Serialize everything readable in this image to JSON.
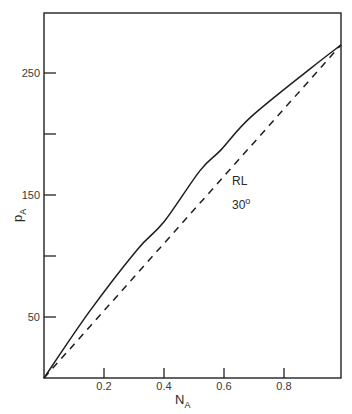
{
  "chart_data": {
    "type": "line",
    "title": "",
    "xlabel": "N",
    "xlabel_sub": "A",
    "ylabel": "p",
    "ylabel_sub": "A",
    "xlim": [
      0,
      0.99
    ],
    "ylim": [
      0,
      272
    ],
    "x_ticks": [
      0.2,
      0.4,
      0.6,
      0.8
    ],
    "x_tick_labels": [
      "0.2",
      "0.4",
      "0.6",
      "0.8"
    ],
    "y_ticks": [
      50,
      100,
      150,
      200,
      250
    ],
    "y_tick_labels": [
      "50",
      "",
      "150",
      "",
      "250"
    ],
    "grid": false,
    "legend": null,
    "annotations": [
      {
        "text": "RL",
        "x": 0.56,
        "y": 160
      },
      {
        "text": "30",
        "superscript": "o",
        "x": 0.56,
        "y": 140
      }
    ],
    "series": [
      {
        "name": "experimental",
        "style": "solid",
        "x": [
          0,
          0.15,
          0.31,
          0.4,
          0.52,
          0.59,
          0.69,
          0.89,
          0.99
        ],
        "y": [
          0,
          54,
          105,
          128,
          170,
          187,
          214,
          254,
          273
        ]
      },
      {
        "name": "Raoult's law (RL) 30°",
        "style": "dashed",
        "x": [
          0,
          0.99
        ],
        "y": [
          0,
          273
        ]
      }
    ]
  }
}
